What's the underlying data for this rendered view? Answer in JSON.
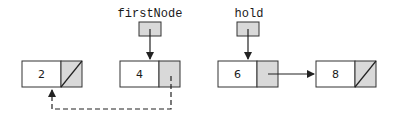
{
  "diagram": {
    "type": "linked-list",
    "colors": {
      "stroke": "#333333",
      "pointer_fill": "#d9d9d9",
      "data_fill": "#ffffff"
    },
    "nodes": [
      {
        "value": "2",
        "next": "null"
      },
      {
        "value": "4",
        "next": "2 (dashed)"
      },
      {
        "value": "6",
        "next": "8"
      },
      {
        "value": "8",
        "next": "null"
      }
    ],
    "references": [
      {
        "name": "firstNode",
        "points_to": "4"
      },
      {
        "name": "hold",
        "points_to": "6"
      }
    ]
  }
}
